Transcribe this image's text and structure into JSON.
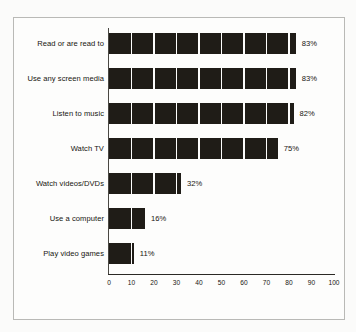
{
  "chart_data": {
    "type": "bar",
    "orientation": "horizontal",
    "title": "",
    "subtitle": "",
    "xlabel": "",
    "ylabel": "",
    "xlim": [
      0,
      100
    ],
    "xticks": [
      "0",
      "10",
      "20",
      "30",
      "40",
      "50",
      "60",
      "70",
      "80",
      "90",
      "100"
    ],
    "xtick_values": [
      0,
      10,
      20,
      30,
      40,
      50,
      60,
      70,
      80,
      90,
      100
    ],
    "grid": false,
    "legend": null,
    "bar_color": "#1f1c17",
    "categories": [
      "Read or are read to",
      "Use any screen media",
      "Listen to music",
      "Watch TV",
      "Watch videos/DVDs",
      "Use a computer",
      "Play video games"
    ],
    "values": [
      83,
      83,
      82,
      75,
      32,
      16,
      11
    ],
    "value_labels": [
      "83%",
      "83%",
      "82%",
      "75%",
      "32%",
      "16%",
      "11%"
    ]
  },
  "figure": {
    "border_color": "#b9b9b6",
    "background": "#fdfdfc"
  }
}
